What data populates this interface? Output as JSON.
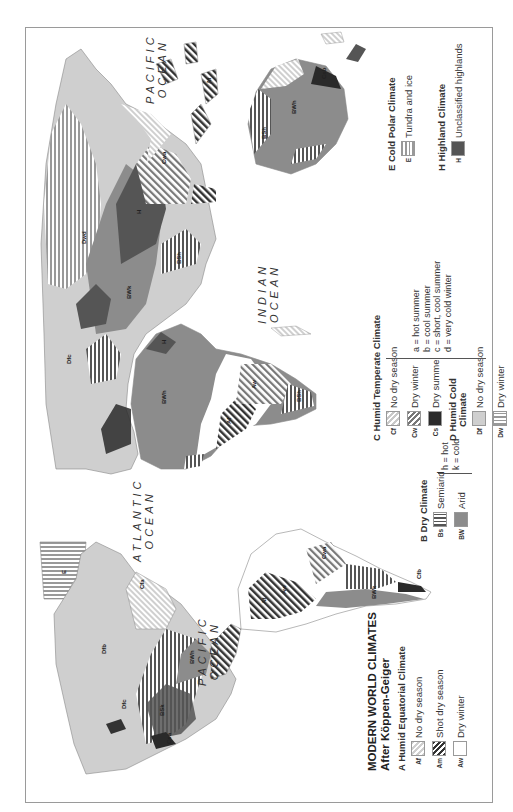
{
  "map": {
    "title": "MODERN WORLD CLIMATES",
    "subtitle": "After Köppen-Geiger",
    "orientation": "rotated 90° counter-clockwise",
    "oceans": [
      {
        "name": "pacific-west",
        "line1": "PACIFIC",
        "line2": "OCEAN"
      },
      {
        "name": "atlantic",
        "line1": "ATLANTIC",
        "line2": "OCEAN"
      },
      {
        "name": "indian",
        "line1": "INDIAN",
        "line2": "OCEAN"
      },
      {
        "name": "pacific-east",
        "line1": "PACIFIC",
        "line2": "OCEAN"
      }
    ],
    "region_labels": {
      "north_america": [
        "E",
        "H",
        "E",
        "Cfc",
        "Cfb",
        "Csb",
        "Csa",
        "BWh",
        "BSk",
        "Dfc",
        "Dfb",
        "Dfa",
        "BWk",
        "Cfa",
        "BSh",
        "Aw",
        "Am",
        "Af",
        "E",
        "Dfc",
        "Dfb"
      ],
      "south_america": [
        "Af",
        "Am",
        "Aw",
        "Af",
        "BWh",
        "BSh",
        "Aw",
        "Af",
        "Cwb",
        "Af",
        "Aw",
        "BSh",
        "Cfa",
        "Cwa",
        "BWk",
        "BSk",
        "Cfb",
        "Csb",
        "BWh",
        "Cfb"
      ],
      "africa": [
        "BWh",
        "H",
        "BSh",
        "Aw",
        "Af",
        "Am",
        "Aw",
        "BSh",
        "Cwa",
        "Cwb",
        "BSk",
        "BWh",
        "Csb",
        "Cfb",
        "Cfa",
        "Aw",
        "Af",
        "Cwa",
        "BWh"
      ],
      "eurasia": [
        "E",
        "Cfc",
        "Cfb",
        "Csa",
        "Csb",
        "Dfb",
        "Dfc",
        "Dfd",
        "Dwd",
        "Dwc",
        "Dwb",
        "Dwa",
        "BWk",
        "BSk",
        "H",
        "BSh",
        "BWh",
        "Cwa",
        "Cfa",
        "Aw",
        "Am",
        "Af",
        "Dfa"
      ],
      "australia": [
        "Af",
        "H",
        "Am",
        "Aw",
        "Cwa",
        "Cfa",
        "BSh",
        "BWh",
        "BSk",
        "Csa",
        "Csb",
        "Cfb",
        "Cfb"
      ]
    }
  },
  "legend": {
    "A": {
      "heading": "A  Humid Equatorial Climate",
      "items": [
        {
          "code": "Af",
          "label": "No dry season"
        },
        {
          "code": "Am",
          "label": "Shot dry season"
        },
        {
          "code": "Aw",
          "label": "Dry winter"
        }
      ]
    },
    "B": {
      "heading": "B  Dry Climate",
      "items": [
        {
          "code": "Bs",
          "label": "Semiarid"
        },
        {
          "code": "BW",
          "label": "Arid"
        }
      ],
      "notes": [
        "h = hot",
        "k = cold"
      ]
    },
    "C": {
      "heading": "C  Humid Temperate Climate",
      "items": [
        {
          "code": "Cf",
          "label": "No dry season"
        },
        {
          "code": "Cw",
          "label": "Dry winter"
        },
        {
          "code": "Cs",
          "label": "Dry summe"
        }
      ]
    },
    "D": {
      "heading_line1": "D  Humid Cold",
      "heading_line2": "Climate",
      "items": [
        {
          "code": "Df",
          "label": "No dry season"
        },
        {
          "code": "Dw",
          "label": "Dry winter"
        }
      ]
    },
    "CD_notes": [
      "a = hot summer",
      "b = cool summer",
      "c = short, cool summer",
      "d = very cold winter"
    ],
    "E": {
      "heading": "E  Cold Polar Climate",
      "items": [
        {
          "code": "E",
          "label": "Tundra and ice"
        }
      ]
    },
    "H": {
      "heading": "H  Highland Climate",
      "items": [
        {
          "code": "H",
          "label": "Unclassified highlands"
        }
      ]
    }
  },
  "colors": {
    "frame": "#9a9a9a",
    "humid_cold_Df": "#cfcfcf",
    "arid_BW": "#8c8c8c",
    "dry_summer_Cs": "#2a2a2a",
    "highland_H": "#555555",
    "text": "#222222"
  }
}
